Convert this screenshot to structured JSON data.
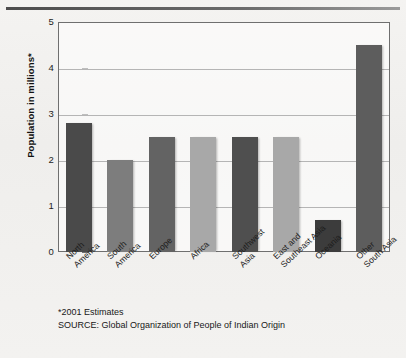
{
  "chart_data": {
    "type": "bar",
    "title": "",
    "xlabel": "",
    "ylabel": "Population in millions*",
    "ylim": [
      0,
      5
    ],
    "yticks": [
      "0",
      "1",
      "2",
      "3",
      "4",
      "5"
    ],
    "grid": true,
    "legend": "none",
    "categories": [
      "North America",
      "South America",
      "Europe",
      "Africa",
      "Southwest Asia",
      "East and Southeast Asia",
      "Oceania",
      "Other South Asia"
    ],
    "category_lines": [
      [
        "North",
        "America"
      ],
      [
        "South",
        "America"
      ],
      [
        "Europe",
        ""
      ],
      [
        "Africa",
        ""
      ],
      [
        "Southwest",
        "Asia"
      ],
      [
        "East and",
        "Southeast Asia"
      ],
      [
        "Oceania",
        ""
      ],
      [
        "Other",
        "South Asia"
      ]
    ],
    "values": [
      2.8,
      2.0,
      2.5,
      2.5,
      2.5,
      2.5,
      0.7,
      4.5
    ],
    "bar_colors": [
      "#4a4a4a",
      "#7d7d7d",
      "#636363",
      "#a8a8a8",
      "#4f4f4f",
      "#a8a8a8",
      "#3c3c3c",
      "#5d5d5d"
    ]
  },
  "footnotes": {
    "estimates": "*2001 Estimates",
    "source": "SOURCE: Global Organization of People of Indian Origin"
  },
  "colors": {
    "frame": "#6f6f6f",
    "grid": "#b5b5b5",
    "background": "#f2f1ef",
    "text": "#1b1b1b"
  }
}
